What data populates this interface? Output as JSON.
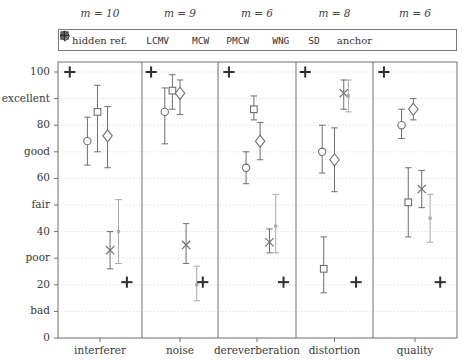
{
  "chart_data": {
    "type": "scatter",
    "title": "",
    "xlabel": "",
    "ylabel": "",
    "ylim": [
      0,
      105
    ],
    "grid": true,
    "legend_position": "top-inside",
    "y_ticks_numeric": [
      0,
      20,
      40,
      60,
      80,
      100
    ],
    "y_ticks_words": [
      {
        "value": 10,
        "label": "bad"
      },
      {
        "value": 30,
        "label": "poor"
      },
      {
        "value": 50,
        "label": "fair"
      },
      {
        "value": 70,
        "label": "good"
      },
      {
        "value": 90,
        "label": "excellent"
      }
    ],
    "y_tick_labels_all": [
      "0",
      "bad",
      "20",
      "poor",
      "40",
      "fair",
      "60",
      "good",
      "80",
      "excellent",
      "100"
    ],
    "legend": [
      {
        "marker": "plus-bold",
        "label": "hidden ref."
      },
      {
        "marker": "circle",
        "label": "LCMV"
      },
      {
        "marker": "square",
        "label": "MCW"
      },
      {
        "marker": "diamond",
        "label": "PMCW"
      },
      {
        "marker": "cross",
        "label": "WNG"
      },
      {
        "marker": "dot",
        "label": "SD"
      },
      {
        "marker": "plus-bold",
        "label": "anchor"
      }
    ],
    "categories": [
      "interferer",
      "noise",
      "dereverberation",
      "distortion",
      "quality"
    ],
    "panel_annotations": [
      "m = 10",
      "m = 9",
      "m = 6",
      "m = 8",
      "m = 6"
    ],
    "panels": [
      {
        "name": "interferer",
        "annotation": "m = 10",
        "points": [
          {
            "series": "hidden ref.",
            "marker": "plus-bold",
            "value": 100,
            "low": 100,
            "high": 100
          },
          {
            "series": "LCMV",
            "marker": "circle",
            "value": 74,
            "low": 65,
            "high": 83
          },
          {
            "series": "MCW",
            "marker": "square",
            "value": 85,
            "low": 70,
            "high": 95
          },
          {
            "series": "PMCW",
            "marker": "diamond",
            "value": 76,
            "low": 64,
            "high": 87
          },
          {
            "series": "WNG",
            "marker": "cross",
            "value": 33,
            "low": 26,
            "high": 40
          },
          {
            "series": "SD",
            "marker": "dot",
            "value": 40,
            "low": 28,
            "high": 52
          },
          {
            "series": "anchor",
            "marker": "plus-bold",
            "value": 21,
            "low": 21,
            "high": 21
          }
        ]
      },
      {
        "name": "noise",
        "annotation": "m = 9",
        "points": [
          {
            "series": "hidden ref.",
            "marker": "plus-bold",
            "value": 100,
            "low": 100,
            "high": 100
          },
          {
            "series": "LCMV",
            "marker": "circle",
            "value": 85,
            "low": 73,
            "high": 94
          },
          {
            "series": "MCW",
            "marker": "square",
            "value": 93,
            "low": 86,
            "high": 99
          },
          {
            "series": "PMCW",
            "marker": "diamond",
            "value": 92,
            "low": 84,
            "high": 97
          },
          {
            "series": "WNG",
            "marker": "cross",
            "value": 35,
            "low": 28,
            "high": 43
          },
          {
            "series": "SD",
            "marker": "dot",
            "value": 20,
            "low": 14,
            "high": 27
          },
          {
            "series": "anchor",
            "marker": "plus-bold",
            "value": 21,
            "low": 21,
            "high": 21
          }
        ]
      },
      {
        "name": "dereverberation",
        "annotation": "m = 6",
        "points": [
          {
            "series": "hidden ref.",
            "marker": "plus-bold",
            "value": 100,
            "low": 100,
            "high": 100
          },
          {
            "series": "LCMV",
            "marker": "circle",
            "value": 64,
            "low": 58,
            "high": 70
          },
          {
            "series": "MCW",
            "marker": "square",
            "value": 86,
            "low": 82,
            "high": 91
          },
          {
            "series": "PMCW",
            "marker": "diamond",
            "value": 74,
            "low": 67,
            "high": 81
          },
          {
            "series": "WNG",
            "marker": "cross",
            "value": 36,
            "low": 32,
            "high": 41
          },
          {
            "series": "SD",
            "marker": "dot",
            "value": 42,
            "low": 32,
            "high": 54
          },
          {
            "series": "anchor",
            "marker": "plus-bold",
            "value": 21,
            "low": 21,
            "high": 21
          }
        ]
      },
      {
        "name": "distortion",
        "annotation": "m = 8",
        "points": [
          {
            "series": "hidden ref.",
            "marker": "plus-bold",
            "value": 100,
            "low": 100,
            "high": 100
          },
          {
            "series": "LCMV",
            "marker": "circle",
            "value": 70,
            "low": 62,
            "high": 80
          },
          {
            "series": "MCW",
            "marker": "square",
            "value": 26,
            "low": 17,
            "high": 38
          },
          {
            "series": "PMCW",
            "marker": "diamond",
            "value": 67,
            "low": 55,
            "high": 79
          },
          {
            "series": "WNG",
            "marker": "cross",
            "value": 92,
            "low": 86,
            "high": 97
          },
          {
            "series": "SD",
            "marker": "dot",
            "value": 91,
            "low": 85,
            "high": 97
          },
          {
            "series": "anchor",
            "marker": "plus-bold",
            "value": 21,
            "low": 21,
            "high": 21
          }
        ]
      },
      {
        "name": "quality",
        "annotation": "m = 6",
        "points": [
          {
            "series": "hidden ref.",
            "marker": "plus-bold",
            "value": 100,
            "low": 100,
            "high": 100
          },
          {
            "series": "LCMV",
            "marker": "circle",
            "value": 80,
            "low": 75,
            "high": 86
          },
          {
            "series": "MCW",
            "marker": "square",
            "value": 51,
            "low": 38,
            "high": 64
          },
          {
            "series": "PMCW",
            "marker": "diamond",
            "value": 86,
            "low": 82,
            "high": 90
          },
          {
            "series": "WNG",
            "marker": "cross",
            "value": 56,
            "low": 49,
            "high": 63
          },
          {
            "series": "SD",
            "marker": "dot",
            "value": 45,
            "low": 36,
            "high": 54
          },
          {
            "series": "anchor",
            "marker": "plus-bold",
            "value": 21,
            "low": 21,
            "high": 21
          }
        ]
      }
    ]
  },
  "colors": {
    "axis": "#707070",
    "grid": "#cfcfcf",
    "dark_marker": "#2e2e2e",
    "mid_marker": "#6e6e6e",
    "light_marker": "#a8a8a8",
    "text": "#3a3a3a"
  }
}
